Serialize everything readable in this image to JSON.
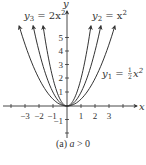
{
  "chart_data": {
    "type": "line",
    "title": "",
    "caption": "(a) a > 0",
    "xlabel": "x",
    "ylabel": "y",
    "xlim": [
      -4.5,
      5
    ],
    "ylim": [
      -2.3,
      6.8
    ],
    "x_ticks": [
      -3,
      -2,
      -1,
      1,
      2,
      3
    ],
    "y_ticks": [
      -1,
      1,
      2,
      3,
      4,
      5
    ],
    "x_tick_labels": [
      "−3",
      "−2",
      "−1",
      "1",
      "2",
      "3"
    ],
    "y_tick_labels": [
      "−1",
      "1",
      "2",
      "3",
      "4",
      "5"
    ],
    "grid": false,
    "series": [
      {
        "name": "y3 = 2x^2",
        "label_main": "y",
        "label_sub": "3",
        "label_rest": " = 2x",
        "label_sup": "2",
        "a": 2,
        "x_range": [
          -1.71,
          1.71
        ]
      },
      {
        "name": "y2 = x^2",
        "label_main": "y",
        "label_sub": "2",
        "label_rest": " = x",
        "label_sup": "2",
        "a": 1,
        "x_range": [
          -2.42,
          2.42
        ]
      },
      {
        "name": "y1 = (1/2)x^2",
        "label_main": "y",
        "label_sub": "1",
        "label_rest": " = ",
        "label_frac_num": "1",
        "label_frac_den": "2",
        "label_tail": "x",
        "label_sup": "2",
        "a": 0.5,
        "x_range": [
          -3.42,
          3.42
        ]
      }
    ]
  },
  "caption": {
    "prefix": "(a) ",
    "var": "a",
    "suffix": " > 0"
  },
  "axis": {
    "x_label": "x",
    "y_label": "y"
  }
}
